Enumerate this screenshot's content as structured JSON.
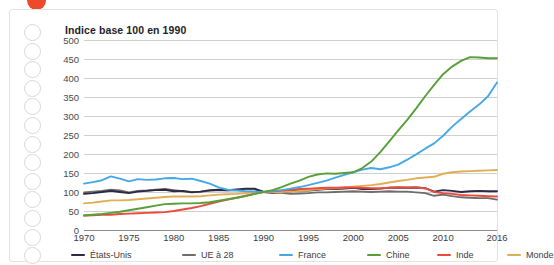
{
  "decor": {
    "top_dot_color": "#ec4a2a",
    "hole_count": 13,
    "panel_border_color": "#e3e3e3"
  },
  "chart_data": {
    "type": "line",
    "title": "Indice base 100 en 1990",
    "xlabel": "",
    "ylabel": "",
    "xlim": [
      1970,
      2016
    ],
    "ylim": [
      0,
      500
    ],
    "grid": true,
    "legend_position": "bottom",
    "ytick_labels": [
      "500",
      "450",
      "400",
      "350",
      "300",
      "250",
      "200",
      "150",
      "100",
      "50",
      "0"
    ],
    "yticks": [
      500,
      450,
      400,
      350,
      300,
      250,
      200,
      150,
      100,
      50,
      0
    ],
    "xtick_labels": [
      "1970",
      "1975",
      "1980",
      "1985",
      "1990",
      "1995",
      "2000",
      "2005",
      "2010",
      "2016"
    ],
    "xticks": [
      1970,
      1975,
      1980,
      1985,
      1990,
      1995,
      2000,
      2005,
      2010,
      2016
    ],
    "x": [
      1970,
      1971,
      1972,
      1973,
      1974,
      1975,
      1976,
      1977,
      1978,
      1979,
      1980,
      1981,
      1982,
      1983,
      1984,
      1985,
      1986,
      1987,
      1988,
      1989,
      1990,
      1991,
      1992,
      1993,
      1994,
      1995,
      1996,
      1997,
      1998,
      1999,
      2000,
      2001,
      2002,
      2003,
      2004,
      2005,
      2006,
      2007,
      2008,
      2009,
      2010,
      2011,
      2012,
      2013,
      2014,
      2015,
      2016
    ],
    "series": [
      {
        "name": "États-Unis",
        "color": "#2c2a45",
        "values": [
          95,
          97,
          100,
          103,
          100,
          97,
          101,
          103,
          105,
          106,
          102,
          103,
          99,
          101,
          105,
          106,
          105,
          107,
          109,
          109,
          100,
          98,
          100,
          102,
          104,
          104,
          106,
          108,
          108,
          109,
          111,
          108,
          108,
          109,
          111,
          112,
          111,
          112,
          110,
          101,
          105,
          103,
          100,
          102,
          103,
          102,
          102
        ]
      },
      {
        "name": "UE à 28",
        "color": "#6d6d6d",
        "values": [
          99,
          101,
          103,
          106,
          104,
          99,
          103,
          104,
          106,
          108,
          105,
          102,
          100,
          101,
          103,
          105,
          104,
          105,
          107,
          107,
          100,
          99,
          98,
          95,
          96,
          97,
          99,
          99,
          100,
          101,
          102,
          101,
          100,
          101,
          102,
          101,
          101,
          99,
          97,
          90,
          93,
          89,
          86,
          85,
          84,
          84,
          80
        ]
      },
      {
        "name": "France",
        "color": "#46a8e4",
        "values": [
          122,
          126,
          131,
          141,
          135,
          128,
          134,
          132,
          133,
          136,
          137,
          134,
          135,
          129,
          122,
          112,
          106,
          104,
          102,
          101,
          100,
          103,
          105,
          109,
          113,
          118,
          124,
          130,
          138,
          145,
          152,
          159,
          163,
          160,
          165,
          172,
          185,
          199,
          214,
          228,
          248,
          272,
          292,
          312,
          330,
          352,
          388
        ]
      },
      {
        "name": "Chine",
        "color": "#57a038",
        "values": [
          38,
          40,
          42,
          45,
          48,
          52,
          56,
          60,
          64,
          68,
          69,
          70,
          70,
          71,
          73,
          77,
          81,
          85,
          89,
          95,
          100,
          105,
          113,
          122,
          130,
          140,
          146,
          149,
          148,
          150,
          152,
          163,
          180,
          205,
          233,
          262,
          290,
          320,
          352,
          382,
          410,
          430,
          445,
          455,
          454,
          452,
          452
        ]
      },
      {
        "name": "Inde",
        "color": "#ec4a3c",
        "values": [
          38,
          39,
          40,
          40,
          42,
          43,
          44,
          45,
          46,
          47,
          50,
          54,
          58,
          63,
          69,
          75,
          80,
          85,
          90,
          95,
          100,
          102,
          104,
          106,
          108,
          109,
          110,
          111,
          111,
          112,
          112,
          111,
          110,
          110,
          111,
          112,
          112,
          112,
          110,
          100,
          97,
          95,
          92,
          91,
          90,
          89,
          88
        ]
      },
      {
        "name": "Monde",
        "color": "#e0ae55",
        "values": [
          70,
          72,
          75,
          78,
          78,
          79,
          81,
          83,
          85,
          87,
          88,
          88,
          88,
          89,
          91,
          93,
          94,
          95,
          97,
          99,
          100,
          100,
          100,
          101,
          103,
          105,
          107,
          109,
          110,
          112,
          114,
          116,
          118,
          121,
          125,
          129,
          132,
          136,
          138,
          140,
          148,
          152,
          154,
          155,
          156,
          157,
          158
        ]
      }
    ]
  }
}
